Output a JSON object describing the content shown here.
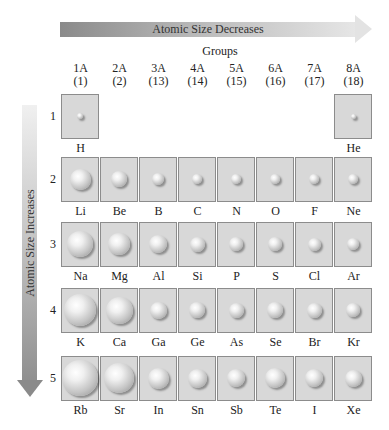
{
  "top_arrow": {
    "label": "Atomic Size Decreases",
    "direction": "right"
  },
  "side_arrow": {
    "label": "Atomic Size Increases",
    "direction": "down"
  },
  "groups_title": "Groups",
  "groups": [
    {
      "name": "1A",
      "number": "(1)"
    },
    {
      "name": "2A",
      "number": "(2)"
    },
    {
      "name": "3A",
      "number": "(13)"
    },
    {
      "name": "4A",
      "number": "(14)"
    },
    {
      "name": "5A",
      "number": "(15)"
    },
    {
      "name": "6A",
      "number": "(16)"
    },
    {
      "name": "7A",
      "number": "(17)"
    },
    {
      "name": "8A",
      "number": "(18)"
    }
  ],
  "periods": [
    {
      "number": "1",
      "elements": [
        {
          "symbol": "H",
          "col": 0,
          "size": 6
        },
        {
          "symbol": "He",
          "col": 7,
          "size": 5
        }
      ]
    },
    {
      "number": "2",
      "elements": [
        {
          "symbol": "Li",
          "col": 0,
          "size": 21
        },
        {
          "symbol": "Be",
          "col": 1,
          "size": 16
        },
        {
          "symbol": "B",
          "col": 2,
          "size": 12
        },
        {
          "symbol": "C",
          "col": 3,
          "size": 10
        },
        {
          "symbol": "N",
          "col": 4,
          "size": 10
        },
        {
          "symbol": "O",
          "col": 5,
          "size": 10
        },
        {
          "symbol": "F",
          "col": 6,
          "size": 10
        },
        {
          "symbol": "Ne",
          "col": 7,
          "size": 10
        }
      ]
    },
    {
      "number": "3",
      "elements": [
        {
          "symbol": "Na",
          "col": 0,
          "size": 26
        },
        {
          "symbol": "Mg",
          "col": 1,
          "size": 22
        },
        {
          "symbol": "Al",
          "col": 2,
          "size": 18
        },
        {
          "symbol": "Si",
          "col": 3,
          "size": 15
        },
        {
          "symbol": "P",
          "col": 4,
          "size": 14
        },
        {
          "symbol": "S",
          "col": 5,
          "size": 14
        },
        {
          "symbol": "Cl",
          "col": 6,
          "size": 13
        },
        {
          "symbol": "Ar",
          "col": 7,
          "size": 12
        }
      ]
    },
    {
      "number": "4",
      "elements": [
        {
          "symbol": "K",
          "col": 0,
          "size": 32
        },
        {
          "symbol": "Ca",
          "col": 1,
          "size": 27
        },
        {
          "symbol": "Ga",
          "col": 2,
          "size": 17
        },
        {
          "symbol": "Ge",
          "col": 3,
          "size": 16
        },
        {
          "symbol": "As",
          "col": 4,
          "size": 15
        },
        {
          "symbol": "Se",
          "col": 5,
          "size": 16
        },
        {
          "symbol": "Br",
          "col": 6,
          "size": 15
        },
        {
          "symbol": "Kr",
          "col": 7,
          "size": 14
        }
      ]
    },
    {
      "number": "5",
      "elements": [
        {
          "symbol": "Rb",
          "col": 0,
          "size": 36
        },
        {
          "symbol": "Sr",
          "col": 1,
          "size": 30
        },
        {
          "symbol": "In",
          "col": 2,
          "size": 21
        },
        {
          "symbol": "Sn",
          "col": 3,
          "size": 19
        },
        {
          "symbol": "Sb",
          "col": 4,
          "size": 18
        },
        {
          "symbol": "Te",
          "col": 5,
          "size": 20
        },
        {
          "symbol": "I",
          "col": 6,
          "size": 18
        },
        {
          "symbol": "Xe",
          "col": 7,
          "size": 17
        }
      ]
    }
  ],
  "colors": {
    "cell_fill": "#d8d8d8",
    "cell_border": "#8c8c8c",
    "arrow_dark": "#8a8a8a",
    "arrow_light": "#e6e6e6"
  }
}
